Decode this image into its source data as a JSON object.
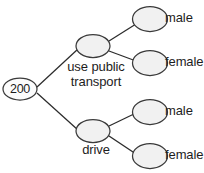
{
  "diagram": {
    "type": "tree-diagram",
    "stroke_color": "#2b2b2b",
    "node_fill_color": "#f1f1f1",
    "root_fill_color": "#fcfcfc",
    "background_color": "#ffffff",
    "root": {
      "value": "200"
    },
    "branches": [
      {
        "label_line_1": "use public",
        "label_line_2": "transport",
        "leaves": [
          {
            "label": "male"
          },
          {
            "label": "female"
          }
        ]
      },
      {
        "label_line_1": "drive",
        "label_line_2": "",
        "leaves": [
          {
            "label": "male"
          },
          {
            "label": "female"
          }
        ]
      }
    ],
    "leaf_labels": [
      "male",
      "female",
      "male",
      "female"
    ]
  }
}
